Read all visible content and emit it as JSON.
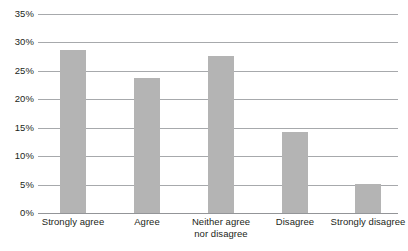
{
  "chart_data": {
    "type": "bar",
    "title": "",
    "subtitle": "",
    "xlabel": "",
    "ylabel": "",
    "categories": [
      "Strongly agree",
      "Agree",
      "Neither agree nor disagree",
      "Disagree",
      "Strongly disagree"
    ],
    "category_lines": [
      [
        "Strongly agree"
      ],
      [
        "Agree"
      ],
      [
        "Neither agree",
        "nor disagree"
      ],
      [
        "Disagree"
      ],
      [
        "Strongly disagree"
      ]
    ],
    "values": [
      28.6,
      23.7,
      27.7,
      14.2,
      5.1
    ],
    "value_labels": [
      "28.6%",
      "23.7%",
      "27.7%",
      "14.2%",
      "5.1%"
    ],
    "ylim": [
      0,
      35
    ],
    "ytick_values": [
      0,
      5,
      10,
      15,
      20,
      25,
      30,
      35
    ],
    "ytick_labels": [
      "0%",
      "5%",
      "10%",
      "15%",
      "20%",
      "25%",
      "30%",
      "35%"
    ],
    "grid": true,
    "grid_axis": "y",
    "legend": false,
    "legend_position": "none",
    "series": [
      {
        "name": "Responses",
        "values": [
          28.6,
          23.7,
          27.7,
          14.2,
          5.1
        ]
      }
    ],
    "colors": {
      "bar": "#b4b4b4",
      "gridline": "#a7a9ac",
      "axis": "#939598",
      "text": "#231f20",
      "background": "#ffffff"
    }
  }
}
